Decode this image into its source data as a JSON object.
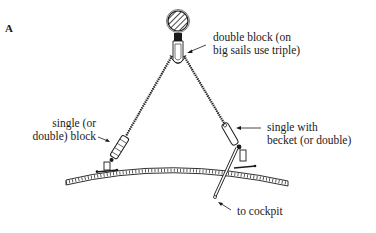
{
  "figure": {
    "letter": "A"
  },
  "labels": {
    "top_block": [
      "double block (on",
      "big sails use triple)"
    ],
    "left_block": [
      "single (or",
      "double) block"
    ],
    "right_block": [
      "single with",
      "becket (or double)"
    ],
    "tail": [
      "to cockpit"
    ]
  },
  "components": [
    {
      "name": "boom-cross-section",
      "shape": "hatched circle"
    },
    {
      "name": "top-block",
      "label_ref": "top_block"
    },
    {
      "name": "left-block",
      "label_ref": "left_block"
    },
    {
      "name": "right-block",
      "label_ref": "right_block"
    },
    {
      "name": "deck-curve",
      "shape": "curved planked line"
    },
    {
      "name": "tail-line",
      "label_ref": "tail"
    }
  ],
  "colors": {
    "ink": "#1a1a1a",
    "background": "#ffffff"
  }
}
